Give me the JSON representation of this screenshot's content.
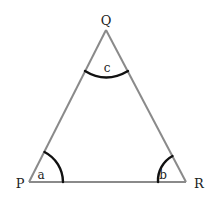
{
  "diagram": {
    "type": "triangle",
    "vertices": {
      "P": {
        "label": "P"
      },
      "Q": {
        "label": "Q"
      },
      "R": {
        "label": "R"
      }
    },
    "angles": {
      "a": {
        "label": "a",
        "vertex": "P"
      },
      "b": {
        "label": "b",
        "vertex": "R"
      },
      "c": {
        "label": "c",
        "vertex": "Q"
      }
    },
    "colors": {
      "side": "#8a8a8a",
      "arc": "#111111",
      "text": "#222222"
    }
  }
}
